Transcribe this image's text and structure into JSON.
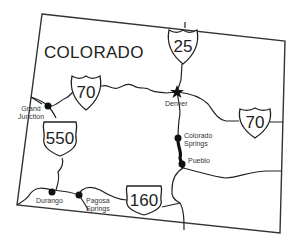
{
  "map": {
    "state_name": "COLORADO",
    "highways": [
      {
        "type": "interstate",
        "number": "25"
      },
      {
        "type": "interstate",
        "number": "70",
        "position": "west"
      },
      {
        "type": "interstate",
        "number": "70",
        "position": "east"
      },
      {
        "type": "us",
        "number": "550"
      },
      {
        "type": "us",
        "number": "160"
      }
    ],
    "cities": [
      {
        "name": "Denver",
        "marker": "star"
      },
      {
        "name": "Grand Junction",
        "line1": "Grand",
        "line2": "Junction",
        "marker": "dot"
      },
      {
        "name": "Colorado Springs",
        "line1": "Colorado",
        "line2": "Springs",
        "marker": "dot"
      },
      {
        "name": "Pueblo",
        "marker": "dot"
      },
      {
        "name": "Durango",
        "marker": "dot"
      },
      {
        "name": "Pagosa Springs",
        "line1": "Pagosa",
        "line2": "Springs",
        "marker": "dot"
      }
    ]
  }
}
